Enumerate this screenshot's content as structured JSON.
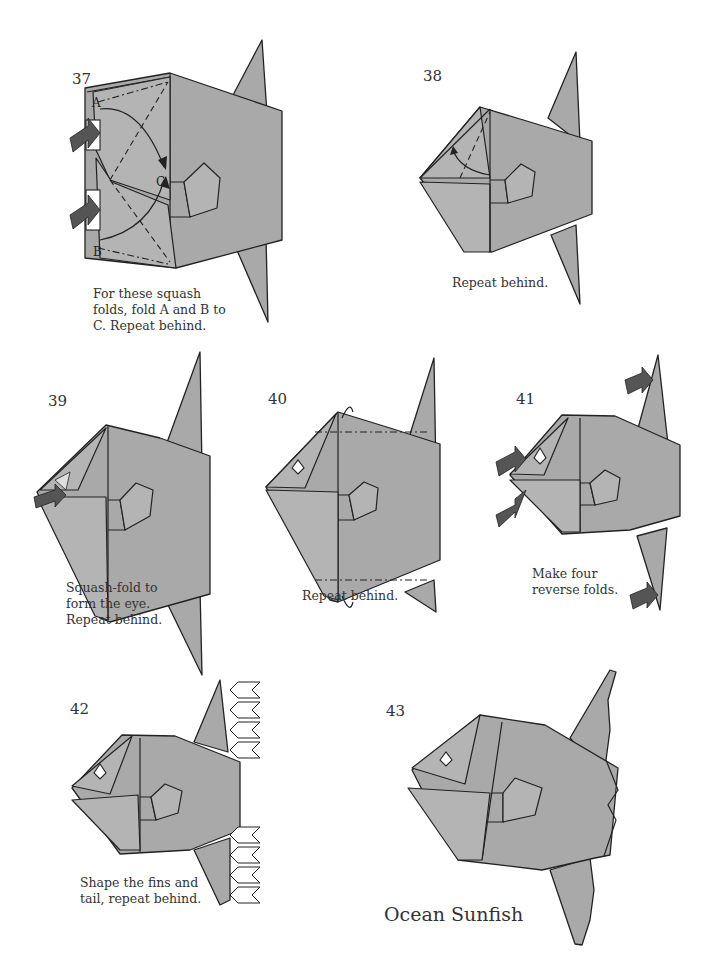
{
  "page": {
    "title": "Ocean Sunfish",
    "palette": {
      "paper": "#a9a9a9",
      "paper_light": "#b4b4b4",
      "line": "#222222",
      "background": "#ffffff",
      "text": "#333333"
    }
  },
  "steps": [
    {
      "number": "37",
      "caption": "For these squash\nfolds, fold A and B to\nC. Repeat behind.",
      "labels": [
        "A",
        "B",
        "C"
      ],
      "symbols": [
        "push-arrow",
        "push-arrow",
        "valley-fold-line",
        "mountain-fold-line",
        "curved-arrow"
      ]
    },
    {
      "number": "38",
      "caption": "Repeat behind.",
      "symbols": [
        "valley-fold-line",
        "curved-arrow"
      ]
    },
    {
      "number": "39",
      "caption": "Squash-fold to\nform the eye.\nRepeat behind.",
      "symbols": [
        "push-arrow"
      ]
    },
    {
      "number": "40",
      "caption": "Repeat behind.",
      "symbols": [
        "mountain-fold-line",
        "turn-behind-arrow",
        "turn-behind-arrow"
      ]
    },
    {
      "number": "41",
      "caption": "Make four\nreverse folds.",
      "symbols": [
        "push-arrow",
        "push-arrow",
        "push-arrow",
        "push-arrow"
      ]
    },
    {
      "number": "42",
      "caption": "Shape the fins and\ntail, repeat behind.",
      "symbols": [
        "repeat-push-arrows"
      ]
    },
    {
      "number": "43",
      "caption": "",
      "symbols": []
    }
  ],
  "final_title": "Ocean Sunfish"
}
